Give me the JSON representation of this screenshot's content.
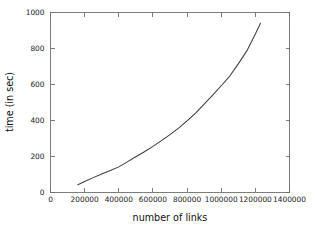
{
  "chart_data": {
    "type": "line",
    "title": "",
    "subtitle": "",
    "xlabel": "number of links",
    "ylabel": "time (in sec)",
    "xlim": [
      0,
      1400000
    ],
    "ylim": [
      0,
      1000
    ],
    "xticks": [
      0,
      200000,
      400000,
      600000,
      800000,
      1000000,
      1200000,
      1400000
    ],
    "xtick_labels": [
      "0",
      "200000",
      "400000",
      "600000",
      "800000",
      "1000000",
      "1200000",
      "1400000"
    ],
    "yticks": [
      0,
      200,
      400,
      600,
      800,
      1000
    ],
    "ytick_labels": [
      "0",
      "200",
      "400",
      "600",
      "800",
      "1000"
    ],
    "grid": false,
    "legend": "none",
    "frame": "box",
    "tick_direction": "in",
    "line_color": "#3d3d3d",
    "frame_color": "#6f6f6f",
    "background_color": "#ffffff",
    "series": [
      {
        "name": "time",
        "x": [
          160000,
          200000,
          250000,
          300000,
          350000,
          400000,
          450000,
          500000,
          550000,
          600000,
          650000,
          700000,
          750000,
          800000,
          850000,
          900000,
          950000,
          1000000,
          1050000,
          1100000,
          1150000,
          1200000,
          1230000
        ],
        "values": [
          40,
          58,
          80,
          100,
          120,
          140,
          168,
          196,
          224,
          254,
          286,
          320,
          356,
          396,
          440,
          490,
          540,
          592,
          646,
          714,
          786,
          880,
          940
        ]
      }
    ]
  }
}
